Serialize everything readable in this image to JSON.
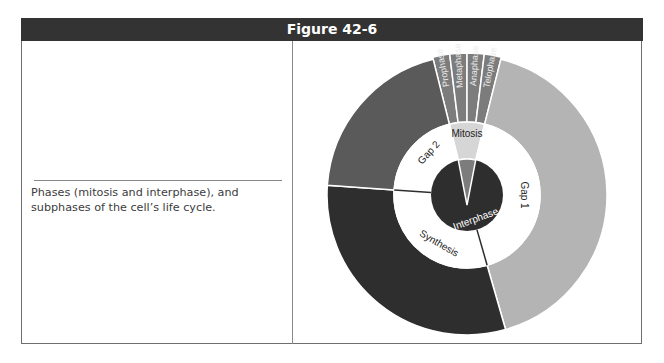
{
  "figure": {
    "title": "Figure 42-6",
    "caption": "Phases (mitosis and interphase), and subphases of the cell’s life cycle."
  },
  "chart_data": {
    "type": "pie",
    "subtype": "nested-donut",
    "title": "Figure 42-6",
    "inner_ring": {
      "center_label": "Interphase",
      "segments": [
        {
          "label": "Mitosis",
          "share_deg": 28,
          "color": "#d6d6d6"
        },
        {
          "label": "Gap 1",
          "share_deg": 150,
          "color": "#ffffff"
        },
        {
          "label": "Synthesis",
          "share_deg": 110,
          "color": "#ffffff"
        },
        {
          "label": "Gap 2",
          "share_deg": 72,
          "color": "#ffffff"
        }
      ]
    },
    "outer_ring": {
      "segments": [
        {
          "label": "Prophase",
          "share_deg": 7,
          "color": "#7c7c7c"
        },
        {
          "label": "Metaphase",
          "share_deg": 7,
          "color": "#7c7c7c"
        },
        {
          "label": "Anaphase",
          "share_deg": 7,
          "color": "#7c7c7c"
        },
        {
          "label": "Telophase",
          "share_deg": 7,
          "color": "#7c7c7c"
        },
        {
          "label": "Gap 1",
          "share_deg": 150,
          "color": "#b4b4b4"
        },
        {
          "label": "Synthesis",
          "share_deg": 110,
          "color": "#2e2e2e"
        },
        {
          "label": "Gap 2",
          "share_deg": 72,
          "color": "#5a5a5a"
        }
      ]
    }
  },
  "labels": {
    "center": "Interphase",
    "mitosis": "Mitosis",
    "gap1": "Gap 1",
    "gap2": "Gap 2",
    "synthesis": "Synthesis",
    "prophase": "Prophase",
    "metaphase": "Metaphase",
    "anaphase": "Anaphase",
    "telophase": "Telophase"
  }
}
